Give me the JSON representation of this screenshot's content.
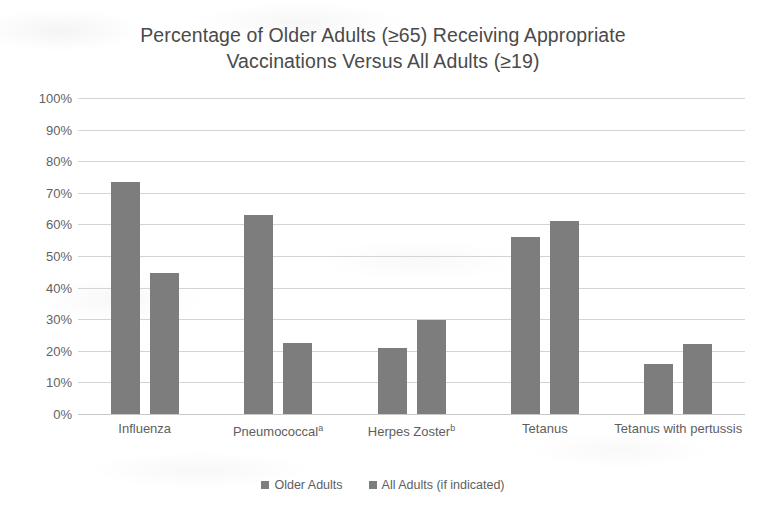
{
  "chart_data": {
    "type": "bar",
    "title": "Percentage of Older Adults (≥65) Receiving Appropriate Vaccinations Versus All Adults (≥19)",
    "title_line1": "Percentage of Older Adults (≥65) Receiving Appropriate",
    "title_line2": "Vaccinations Versus All Adults (≥19)",
    "xlabel": "",
    "ylabel": "",
    "ylim": [
      0,
      100
    ],
    "grid": true,
    "legend_position": "bottom",
    "categories": [
      "Influenza",
      "Pneumococcalᵃ",
      "Herpes Zosterᵇ",
      "Tetanus",
      "Tetanus with pertussis"
    ],
    "category_labels": [
      {
        "text": "Influenza",
        "sup": ""
      },
      {
        "text": "Pneumococcal",
        "sup": "a"
      },
      {
        "text": "Herpes Zoster",
        "sup": "b"
      },
      {
        "text": "Tetanus",
        "sup": ""
      },
      {
        "text": "Tetanus with pertussis",
        "sup": ""
      }
    ],
    "series": [
      {
        "name": "Older Adults",
        "color": "#7d7d7d",
        "values": [
          73.5,
          63.0,
          21.0,
          56.0,
          15.8
        ]
      },
      {
        "name": "All Adults (if indicated)",
        "color": "#7d7d7d",
        "values": [
          44.5,
          22.5,
          29.7,
          61.0,
          22.0
        ]
      }
    ],
    "ytick_labels": [
      "100%",
      "90%",
      "80%",
      "70%",
      "60%",
      "50%",
      "40%",
      "30%",
      "20%",
      "10%",
      "0%"
    ],
    "ytick_values": [
      100,
      90,
      80,
      70,
      60,
      50,
      40,
      30,
      20,
      10,
      0
    ]
  },
  "legend": {
    "items": [
      {
        "label": "Older Adults",
        "color": "#7d7d7d"
      },
      {
        "label": "All Adults (if indicated)",
        "color": "#7d7d7d"
      }
    ]
  },
  "colors": {
    "bar": "#7d7d7d",
    "gridline": "#d4d4d4",
    "text": "#5e5e5e",
    "title": "#4a4a4a",
    "background": "#ffffff"
  }
}
